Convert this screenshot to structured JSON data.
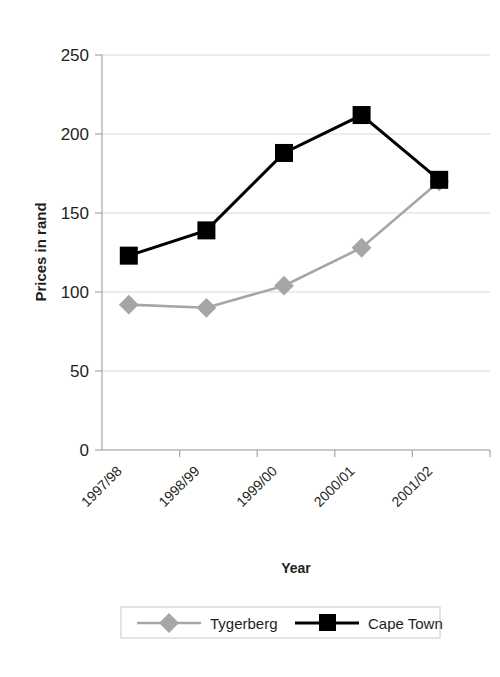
{
  "chart_data": {
    "type": "line",
    "title": "",
    "xlabel": "Year",
    "ylabel": "Prices in rand",
    "categories": [
      "1997/98",
      "1998/99",
      "1999/00",
      "2000/01",
      "2001/02"
    ],
    "ylim": [
      0,
      250
    ],
    "yticks": [
      0,
      50,
      100,
      150,
      200,
      250
    ],
    "ytick_labels": [
      "0",
      "50",
      "100",
      "150",
      "200",
      "250"
    ],
    "grid": "horizontal",
    "legend_position": "bottom",
    "series": [
      {
        "name": "Tygerberg",
        "color": "#a6a6a6",
        "marker": "diamond",
        "values": [
          92,
          90,
          104,
          128,
          170
        ]
      },
      {
        "name": "Cape Town",
        "color": "#000000",
        "marker": "square",
        "values": [
          123,
          139,
          188,
          212,
          171
        ]
      }
    ]
  },
  "legend": {
    "items": [
      {
        "label": "Tygerberg",
        "marker": "diamond-marker-icon"
      },
      {
        "label": "Cape Town",
        "marker": "square-marker-icon"
      }
    ]
  }
}
